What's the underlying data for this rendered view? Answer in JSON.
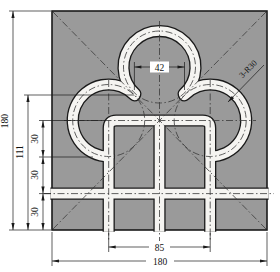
{
  "colors": {
    "plate": "#9a9a9a",
    "slot": "#f5f4f1",
    "line": "#1a1a1a",
    "centerline": "#3a3a3a"
  },
  "dimensions": {
    "left_total": "180",
    "left_111": "111",
    "left_30_top": "30",
    "left_30_mid": "30",
    "left_30_bot": "30",
    "top_42": "42",
    "bottom_85": "85",
    "bottom_180": "180",
    "radius_note": "3-R30"
  }
}
